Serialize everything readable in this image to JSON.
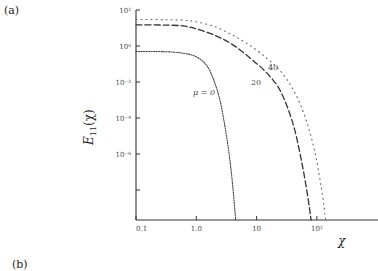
{
  "panels": {
    "a_label": "(a)",
    "b_label": "(b)"
  },
  "chart_data": {
    "type": "line",
    "title": "",
    "xlabel": "χ",
    "ylabel": "E11(χ)",
    "ylabel_main": "E",
    "ylabel_sub": "11",
    "ylabel_arg": "(χ)",
    "xscale": "log",
    "yscale": "log",
    "xlim": [
      0.1,
      300
    ],
    "ylim": [
      1e-10,
      100
    ],
    "x_ticks": [
      {
        "value": 0.1,
        "label": "0.1"
      },
      {
        "value": 1,
        "label": "1.0"
      },
      {
        "value": 10,
        "label": "10"
      },
      {
        "value": 100,
        "label": "10²"
      }
    ],
    "y_ticks": [
      {
        "value": 100,
        "label": "10²"
      },
      {
        "value": 1,
        "label": "10⁰"
      },
      {
        "value": 0.01,
        "label": "10⁻²"
      },
      {
        "value": 0.0001,
        "label": "10⁻⁴"
      },
      {
        "value": 1e-06,
        "label": "10⁻⁶"
      },
      {
        "value": 1e-08,
        "label": ""
      }
    ],
    "grid": false,
    "legend": "inline-labels",
    "series": [
      {
        "name": "μ = 0",
        "label": "μ = 0",
        "style": "fine-dotted",
        "x": [
          0.1,
          0.3,
          0.6,
          1.0,
          1.5,
          2.0,
          2.5,
          3.0,
          3.5,
          4.0,
          4.5
        ],
        "y": [
          0.5,
          0.48,
          0.4,
          0.25,
          0.08,
          0.01,
          0.0008,
          3e-05,
          1e-06,
          2e-08,
          1e-10
        ]
      },
      {
        "name": "μ = 20",
        "label": "20",
        "style": "dashed",
        "x": [
          0.1,
          0.3,
          0.6,
          1.0,
          2.0,
          4.0,
          8.0,
          15,
          25,
          40,
          55,
          70,
          80
        ],
        "y": [
          15,
          14.5,
          13,
          9,
          4,
          1.2,
          0.2,
          0.03,
          0.003,
          5e-05,
          5e-07,
          5e-09,
          1e-10
        ]
      },
      {
        "name": "μ = 40",
        "label": "40",
        "style": "sparse-dotted",
        "x": [
          0.1,
          0.3,
          0.6,
          1.0,
          2.0,
          4.0,
          8.0,
          15,
          25,
          40,
          60,
          90,
          120,
          140
        ],
        "y": [
          30,
          29,
          27,
          22,
          12,
          4,
          1.0,
          0.2,
          0.04,
          0.004,
          0.0002,
          2e-06,
          1e-08,
          1e-10
        ]
      }
    ]
  }
}
